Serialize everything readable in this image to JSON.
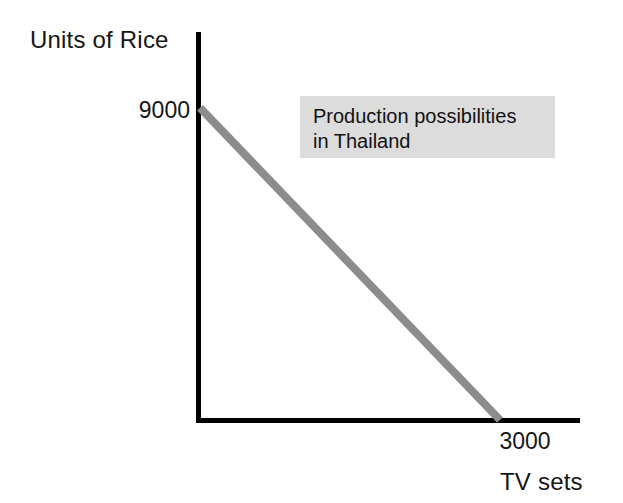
{
  "figure": {
    "background_color": "#ffffff",
    "axis_color": "#000000",
    "curve_color": "#8c8c8c",
    "annotation_bg_color": "#dcdcdc"
  },
  "axes": {
    "y_title": "Units of Rice",
    "x_title": "TV sets",
    "y_intercept_label": "9000",
    "x_intercept_label": "3000"
  },
  "annotation": {
    "line1": "Production possibilities",
    "line2": "in Thailand"
  },
  "chart_data": {
    "type": "line",
    "title": "",
    "subtitle": "",
    "annotations": [
      "Production possibilities in Thailand"
    ],
    "xlabel": "TV sets",
    "ylabel": "Units of Rice",
    "xlim": [
      0,
      3800
    ],
    "ylim": [
      0,
      11100
    ],
    "xticks": [
      3000
    ],
    "yticks": [
      9000
    ],
    "xticklabels": [
      "3000"
    ],
    "yticklabels": [
      "9000"
    ],
    "grid": false,
    "legend": false,
    "series": [
      {
        "name": "Production possibility frontier",
        "color": "#8c8c8c",
        "linewidth": 8,
        "x": [
          0,
          3000
        ],
        "y": [
          9000,
          0
        ]
      }
    ]
  }
}
